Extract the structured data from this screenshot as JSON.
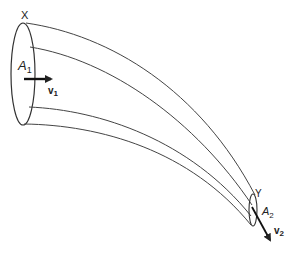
{
  "diagram": {
    "type": "flow-tube",
    "stroke_color": "#333333",
    "labels": {
      "point_x": "X",
      "point_y": "Y",
      "area_1": {
        "base": "A",
        "sub": "1"
      },
      "area_2": {
        "base": "A",
        "sub": "2"
      },
      "velocity_1": {
        "base": "v",
        "sub": "1"
      },
      "velocity_2": {
        "base": "v",
        "sub": "2"
      }
    }
  }
}
